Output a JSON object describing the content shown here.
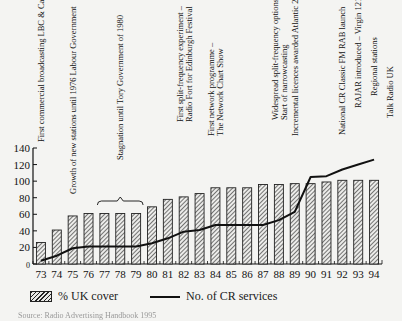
{
  "chart_data": {
    "type": "bar",
    "title": "",
    "xlabel": "",
    "ylabel": "",
    "ylim": [
      0,
      140
    ],
    "yticks": [
      0,
      20,
      40,
      60,
      80,
      100,
      120,
      140
    ],
    "grid": false,
    "legend_position": "bottom",
    "categories": [
      "73",
      "74",
      "75",
      "76",
      "77",
      "78",
      "79",
      "80",
      "81",
      "82",
      "83",
      "84",
      "85",
      "86",
      "87",
      "88",
      "89",
      "90",
      "91",
      "92",
      "93",
      "94"
    ],
    "series": [
      {
        "name": "% UK cover",
        "type": "bar",
        "style": "hatched",
        "values": [
          26,
          41,
          58,
          61,
          61,
          61,
          61,
          69,
          78,
          81,
          85,
          92,
          92,
          92,
          96,
          96,
          97,
          97,
          99,
          101,
          101,
          101
        ]
      },
      {
        "name": "No. of CR services",
        "type": "line",
        "values": [
          4,
          10,
          19,
          21,
          21,
          21,
          21,
          25,
          31,
          39,
          41,
          47,
          47,
          47,
          47,
          53,
          63,
          105,
          106,
          114,
          120,
          126
        ]
      }
    ],
    "annotations": [
      {
        "year": "73",
        "lines": [
          "First commercial broadcasting LBC & Capital"
        ]
      },
      {
        "year": "75",
        "lines": [
          "Growth of new stations until 1976 Labour Government"
        ]
      },
      {
        "year": "77-79",
        "lines": [
          "Stagnation until Tory Government of 1980"
        ],
        "bracket": true
      },
      {
        "year": "82",
        "lines": [
          "First split-frequency experiment –",
          "Radio Fort for Edinburgh Festival"
        ]
      },
      {
        "year": "84",
        "lines": [
          "First network programme –",
          "The Network Chart Show"
        ]
      },
      {
        "year": "88",
        "lines": [
          "Widespread split-frequency options –",
          "Start of narrowcasting"
        ]
      },
      {
        "year": "89",
        "lines": [
          "Incremental licences awarded Atlantic 252"
        ]
      },
      {
        "year": "92",
        "lines": [
          "National CR Classic FM RAB launch"
        ]
      },
      {
        "year": "93",
        "lines": [
          "RAJAR introduced – Virgin 1215"
        ]
      },
      {
        "year": "94",
        "lines": [
          "Regional stations"
        ]
      },
      {
        "year": "95",
        "lines": [
          "Talk Radio UK"
        ]
      }
    ]
  },
  "legend": {
    "bar_label": "% UK cover",
    "line_label": "No. of CR services"
  },
  "source": "Source: Radio Advertising Handbook 1995"
}
